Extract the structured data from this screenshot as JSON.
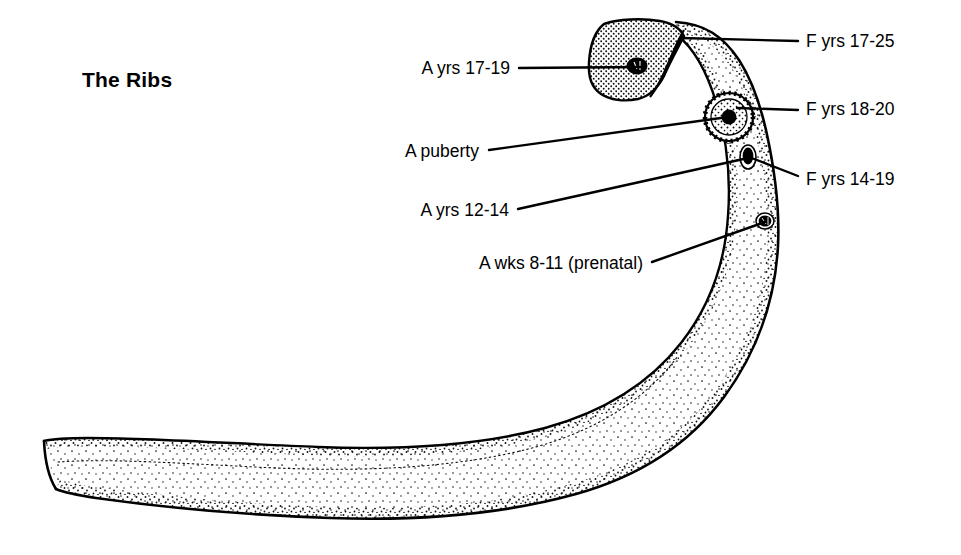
{
  "figure": {
    "title": "The Ribs",
    "background_color": "#ffffff",
    "ink_color": "#000000"
  },
  "annotations": {
    "left": [
      {
        "id": "head-epiphysis",
        "label": "A yrs 17-19",
        "anchor_side": "left",
        "text_x": 510,
        "text_y": 69,
        "leader_from_x": 519,
        "leader_from_y": 68,
        "leader_to_x": 641,
        "leader_to_y": 67
      },
      {
        "id": "tubercle-epiphysis",
        "label": "A puberty",
        "anchor_side": "left",
        "text_x": 479,
        "text_y": 152,
        "leader_from_x": 489,
        "leader_from_y": 150,
        "leader_to_x": 728,
        "leader_to_y": 117
      },
      {
        "id": "angle-ossification",
        "label": "A yrs 12-14",
        "anchor_side": "left",
        "text_x": 509,
        "text_y": 211,
        "leader_from_x": 518,
        "leader_from_y": 209,
        "leader_to_x": 748,
        "leader_to_y": 158
      },
      {
        "id": "shaft-primary-centre",
        "label": "A wks 8-11 (prenatal)",
        "anchor_side": "left",
        "text_x": 644,
        "text_y": 264,
        "leader_from_x": 652,
        "leader_from_y": 262,
        "leader_to_x": 765,
        "leader_to_y": 222
      }
    ],
    "right": [
      {
        "id": "fusion-head",
        "label": "F yrs 17-25",
        "anchor_side": "right",
        "text_x": 806,
        "text_y": 42,
        "leader_from_x": 798,
        "leader_from_y": 41,
        "leader_to_x": 681,
        "leader_to_y": 38
      },
      {
        "id": "fusion-tubercle",
        "label": "F yrs 18-20",
        "anchor_side": "right",
        "text_x": 806,
        "text_y": 110,
        "leader_from_x": 798,
        "leader_from_y": 110,
        "leader_to_x": 737,
        "leader_to_y": 108
      },
      {
        "id": "fusion-angle",
        "label": "F yrs 14-19",
        "anchor_side": "right",
        "text_x": 806,
        "text_y": 180,
        "leader_from_x": 798,
        "leader_from_y": 176,
        "leader_to_x": 747,
        "leader_to_y": 157
      }
    ]
  },
  "rib_structures": {
    "head_epiphysis": {
      "name": "rib-head-epiphysis",
      "shading": "dense-stipple-cap",
      "nucleus": "dark-oval"
    },
    "tubercle_epiphysis": {
      "name": "rib-tubercle-epiphysis",
      "shading": "concentric-ring",
      "nucleus": "dark-solid-centre"
    },
    "angle_nucleus": {
      "name": "rib-angle-ossification-nucleus",
      "shading": "dark-spot"
    },
    "shaft_nucleus": {
      "name": "rib-shaft-ossification-nucleus",
      "shading": "dark-spot"
    },
    "shaft": {
      "name": "rib-shaft",
      "shading": "light-stipple"
    },
    "sternal_end": {
      "name": "rib-sternal-end",
      "shading": "blunt-cut-end"
    }
  }
}
